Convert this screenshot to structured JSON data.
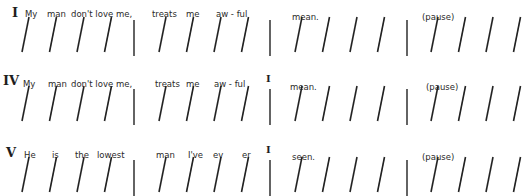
{
  "rows": [
    {
      "chord": "I",
      "words": [
        "My",
        "man",
        "don't love me,",
        "treats",
        "me",
        "aw - ful",
        "mean.",
        "(pause)"
      ],
      "bar_chords": [
        "",
        ""
      ],
      "measures": [
        4,
        4,
        4,
        4
      ]
    },
    {
      "chord": "IV",
      "words": [
        "My",
        "man",
        "don't love me,",
        "treats",
        "me",
        "aw - ful",
        "mean.",
        "(pause)"
      ],
      "bar_chords": [
        "I",
        ""
      ],
      "measures": [
        4,
        4,
        4,
        4
      ]
    },
    {
      "chord": "V",
      "words": [
        "He",
        "is",
        "the",
        "lowest",
        "man",
        "I've",
        "ev",
        "er",
        "seen.",
        "(pause)"
      ],
      "bar_chords": [
        "I",
        ""
      ],
      "measures": [
        4,
        4,
        4,
        4
      ]
    }
  ]
}
